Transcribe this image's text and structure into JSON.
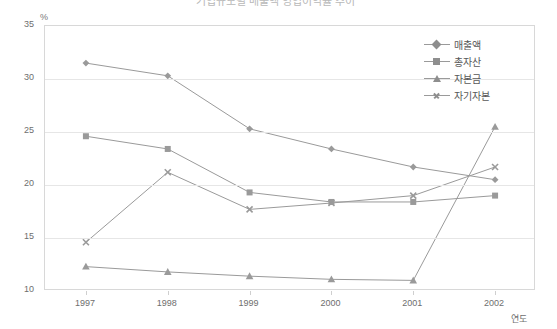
{
  "title": {
    "text": "기업규모별 매출액 영업이익률 추이",
    "visible_fragment": "(clipped at top edge)"
  },
  "axes": {
    "y_unit_label": "%",
    "y_ticks": [
      "35",
      "30",
      "25",
      "20",
      "15",
      "10"
    ],
    "x_ticks": [
      "1997",
      "1998",
      "1999",
      "2000",
      "2001",
      "2002"
    ],
    "x_axis_name": "연도"
  },
  "legend": {
    "position": "top-right",
    "items": [
      {
        "label": "매출액",
        "marker": "diamond-icon",
        "color": "#8e8e8e"
      },
      {
        "label": "총자산",
        "marker": "square-icon",
        "color": "#8e8e8e"
      },
      {
        "label": "자본금",
        "marker": "triangle-icon",
        "color": "#8e8e8e"
      },
      {
        "label": "자기자본",
        "marker": "x-icon",
        "color": "#8e8e8e"
      }
    ]
  },
  "chart_data": {
    "type": "line",
    "title": "기업규모별 매출액 영업이익률 추이",
    "xlabel": "연도",
    "ylabel": "%",
    "categories": [
      "1997",
      "1998",
      "1999",
      "2000",
      "2001",
      "2002"
    ],
    "ylim": [
      10,
      35
    ],
    "y_ticks": [
      10,
      15,
      20,
      25,
      30,
      35
    ],
    "grid": "horizontal",
    "legend_position": "top-right",
    "series": [
      {
        "name": "매출액",
        "marker": "diamond",
        "color": "#9a9a9a",
        "values": [
          31.5,
          30.3,
          25.3,
          23.4,
          21.7,
          20.5
        ]
      },
      {
        "name": "총자산",
        "marker": "square",
        "color": "#9a9a9a",
        "values": [
          24.6,
          23.4,
          19.3,
          18.4,
          18.4,
          19.0
        ]
      },
      {
        "name": "자본금",
        "marker": "triangle",
        "color": "#9a9a9a",
        "values": [
          12.3,
          11.8,
          11.4,
          11.1,
          11.0,
          25.5
        ]
      },
      {
        "name": "자기자본",
        "marker": "x",
        "color": "#9a9a9a",
        "values": [
          14.6,
          21.2,
          17.7,
          18.3,
          19.0,
          21.7
        ]
      }
    ]
  }
}
